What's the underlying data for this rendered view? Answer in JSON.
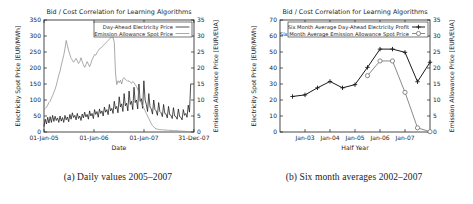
{
  "figure": {
    "subfigures": [
      {
        "caption": "(a) Daily values 2005–2007"
      },
      {
        "caption": "(b) Six month averages 2002–2007"
      }
    ]
  },
  "chart_data": [
    {
      "id": "daily",
      "type": "line",
      "title": "Bid / Cost Correlation for Learning Algorithms",
      "xlabel": "Date",
      "ylabel": "Electricity Spot Price [EUR/MWh]",
      "y2label": "Emission Allowance Price [EUR/EUA]",
      "xlim": [
        0,
        1095
      ],
      "ylim": [
        0,
        350
      ],
      "y2lim": [
        0,
        35
      ],
      "grid": false,
      "legend_position": "top-right",
      "xticks": [
        {
          "value": 0,
          "label": "01-Jan-05"
        },
        {
          "value": 365,
          "label": "01-Jan-06"
        },
        {
          "value": 730,
          "label": "01-Jan-07"
        },
        {
          "value": 1094,
          "label": "31-Dec-07"
        }
      ],
      "yticks": [
        {
          "value": 0,
          "label": "0"
        },
        {
          "value": 50,
          "label": "50"
        },
        {
          "value": 100,
          "label": "100"
        },
        {
          "value": 150,
          "label": "150"
        },
        {
          "value": 200,
          "label": "200"
        },
        {
          "value": 250,
          "label": "250"
        },
        {
          "value": 300,
          "label": "300"
        },
        {
          "value": 350,
          "label": "350"
        }
      ],
      "y2ticks": [
        {
          "value": 0,
          "label": "0"
        },
        {
          "value": 5,
          "label": "5"
        },
        {
          "value": 10,
          "label": "10"
        },
        {
          "value": 15,
          "label": "15"
        },
        {
          "value": 20,
          "label": "20"
        },
        {
          "value": 25,
          "label": "25"
        },
        {
          "value": 30,
          "label": "30"
        },
        {
          "value": 35,
          "label": "35"
        }
      ],
      "series": [
        {
          "name": "Day-Ahead Electricity Price",
          "axis": "left",
          "color": "#151515",
          "style": "solid-dark",
          "units": "EUR/MWh",
          "x": [
            0,
            9,
            18,
            27,
            36,
            45,
            54,
            63,
            72,
            81,
            90,
            99,
            108,
            117,
            126,
            135,
            144,
            153,
            162,
            171,
            180,
            189,
            198,
            207,
            216,
            225,
            234,
            243,
            252,
            261,
            270,
            279,
            288,
            297,
            306,
            315,
            324,
            333,
            342,
            351,
            360,
            369,
            378,
            387,
            396,
            405,
            414,
            423,
            432,
            441,
            450,
            459,
            468,
            477,
            486,
            495,
            504,
            513,
            522,
            531,
            540,
            549,
            558,
            567,
            576,
            585,
            594,
            603,
            612,
            621,
            630,
            639,
            648,
            657,
            666,
            675,
            684,
            693,
            702,
            711,
            720,
            729,
            738,
            747,
            756,
            765,
            774,
            783,
            792,
            801,
            810,
            819,
            828,
            837,
            846,
            855,
            864,
            873,
            882,
            891,
            900,
            909,
            918,
            927,
            936,
            945,
            954,
            963,
            972,
            981,
            990,
            999,
            1008,
            1017,
            1026,
            1035,
            1044,
            1053,
            1062,
            1071,
            1080,
            1094
          ],
          "y": [
            18,
            40,
            25,
            46,
            28,
            48,
            30,
            52,
            33,
            49,
            36,
            44,
            30,
            50,
            34,
            45,
            30,
            52,
            38,
            47,
            32,
            55,
            40,
            60,
            45,
            52,
            38,
            58,
            42,
            50,
            36,
            56,
            44,
            62,
            47,
            55,
            40,
            66,
            50,
            58,
            42,
            70,
            55,
            64,
            46,
            72,
            58,
            66,
            50,
            78,
            62,
            70,
            54,
            86,
            66,
            74,
            58,
            96,
            72,
            80,
            60,
            110,
            78,
            88,
            64,
            120,
            82,
            90,
            66,
            128,
            86,
            96,
            70,
            140,
            92,
            100,
            72,
            150,
            96,
            104,
            74,
            160,
            100,
            86,
            64,
            120,
            78,
            72,
            56,
            100,
            70,
            66,
            52,
            92,
            64,
            60,
            48,
            86,
            58,
            56,
            44,
            80,
            54,
            52,
            42,
            76,
            50,
            48,
            40,
            72,
            48,
            46,
            38,
            70,
            52,
            58,
            46,
            84,
            62,
            150
          ]
        },
        {
          "name": "Emission Allowance Spot Price",
          "axis": "right",
          "color": "#8d8d8d",
          "style": "solid-grey",
          "units": "EUR/EUA",
          "x": [
            0,
            9,
            18,
            27,
            36,
            45,
            54,
            63,
            72,
            81,
            90,
            99,
            108,
            117,
            126,
            135,
            144,
            153,
            162,
            171,
            180,
            189,
            198,
            207,
            216,
            225,
            234,
            243,
            252,
            261,
            270,
            279,
            288,
            297,
            306,
            315,
            324,
            333,
            342,
            351,
            360,
            369,
            378,
            387,
            396,
            405,
            414,
            423,
            432,
            441,
            450,
            459,
            468,
            477,
            486,
            495,
            504,
            513,
            522,
            531,
            540,
            549,
            558,
            567,
            576,
            585,
            594,
            603,
            612,
            621,
            630,
            639,
            648,
            657,
            666,
            675,
            684,
            693,
            702,
            711,
            720,
            729,
            738,
            747,
            756,
            765,
            774,
            783,
            792,
            801,
            810,
            819,
            828,
            837,
            846,
            855,
            864,
            873,
            882,
            891,
            900,
            909,
            918,
            927,
            936,
            945,
            954,
            963,
            972,
            981,
            990,
            999,
            1008,
            1017,
            1026,
            1035,
            1044,
            1053,
            1062,
            1071,
            1080,
            1094
          ],
          "y": [
            7.0,
            7.4,
            7.8,
            8.4,
            9.2,
            9.6,
            10.6,
            11.4,
            12.4,
            13.4,
            14.6,
            16.2,
            17.8,
            19.0,
            20.8,
            22.4,
            24.0,
            26.0,
            28.6,
            27.0,
            25.4,
            24.2,
            23.0,
            22.4,
            21.8,
            22.4,
            23.0,
            22.2,
            21.4,
            22.0,
            23.2,
            22.0,
            21.0,
            20.2,
            21.0,
            22.0,
            21.2,
            20.4,
            21.4,
            22.6,
            23.4,
            24.2,
            24.0,
            24.8,
            25.4,
            26.0,
            26.2,
            26.6,
            27.0,
            27.4,
            27.8,
            28.2,
            28.6,
            29.0,
            29.4,
            29.8,
            29.6,
            28.0,
            18.4,
            14.8,
            16.0,
            15.4,
            16.2,
            15.0,
            16.6,
            17.0,
            16.4,
            16.2,
            15.8,
            16.0,
            15.6,
            15.2,
            15.8,
            15.4,
            14.8,
            14.2,
            13.4,
            12.0,
            9.8,
            9.0,
            8.2,
            7.4,
            6.6,
            5.8,
            5.0,
            4.2,
            3.4,
            2.6,
            2.0,
            1.6,
            1.2,
            1.0,
            0.9,
            0.8,
            0.75,
            0.7,
            0.68,
            0.65,
            0.62,
            0.6,
            0.58,
            0.55,
            0.52,
            0.5,
            0.48,
            0.45,
            0.42,
            0.4,
            0.38,
            0.35,
            0.32,
            0.3,
            0.28,
            0.25,
            0.22,
            0.2,
            0.18,
            0.15,
            0.12,
            0.1
          ]
        }
      ]
    },
    {
      "id": "six-month",
      "type": "line",
      "title": "Bid / Cost Correlation for Learning Algorithms",
      "xlabel": "Half Year",
      "ylabel": "Electricity Spot Price [EUR/MWh]",
      "y2label": "Emission Allowance Price [EUR/EUA]",
      "xlim": [
        0,
        12
      ],
      "ylim": [
        0,
        70
      ],
      "y2lim": [
        0,
        35
      ],
      "grid": false,
      "legend_position": "top-center",
      "xticks": [
        {
          "value": 2,
          "label": "Jan-03"
        },
        {
          "value": 4,
          "label": "Jan-04"
        },
        {
          "value": 6,
          "label": "Jan-05"
        },
        {
          "value": 8,
          "label": "Jan-06"
        },
        {
          "value": 10,
          "label": "Jan-07"
        }
      ],
      "yticks": [
        {
          "value": 0,
          "label": "0"
        },
        {
          "value": 10,
          "label": "10"
        },
        {
          "value": 20,
          "label": "20"
        },
        {
          "value": 30,
          "label": "30"
        },
        {
          "value": 40,
          "label": "40"
        },
        {
          "value": 50,
          "label": "50"
        },
        {
          "value": 60,
          "label": "60"
        },
        {
          "value": 70,
          "label": "70"
        }
      ],
      "y2ticks": [
        {
          "value": 0,
          "label": "0"
        },
        {
          "value": 5,
          "label": "5"
        },
        {
          "value": 10,
          "label": "10"
        },
        {
          "value": 15,
          "label": "15"
        },
        {
          "value": 20,
          "label": "20"
        },
        {
          "value": 25,
          "label": "25"
        },
        {
          "value": 30,
          "label": "30"
        },
        {
          "value": 35,
          "label": "35"
        }
      ],
      "series": [
        {
          "name": "Six Month Average Day-Ahead Electricity Profit",
          "axis": "left",
          "color": "#1a1a1a",
          "marker": "plus",
          "units": "EUR/MWh",
          "x": [
            1,
            2,
            3,
            4,
            5,
            6,
            7,
            8,
            9,
            10,
            11,
            12
          ],
          "y": [
            22.2,
            23.2,
            27.6,
            31.6,
            27.6,
            29.6,
            40.4,
            51.8,
            51.8,
            49.8,
            31.4,
            43.6
          ]
        },
        {
          "name": "Six Month Average Emission Allowance Spot Price",
          "axis": "right",
          "color": "#7d7d7d",
          "marker": "circle",
          "units": "EUR/EUA",
          "x": [
            7,
            8,
            9,
            10,
            11,
            12
          ],
          "y": [
            17.6,
            22.2,
            22.2,
            12.4,
            1.3,
            0.1
          ]
        }
      ]
    }
  ]
}
